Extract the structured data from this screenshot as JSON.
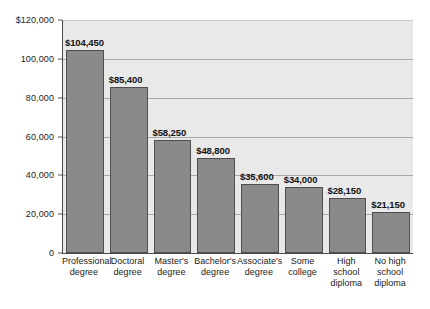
{
  "chart_data": {
    "type": "bar",
    "title": "",
    "subtitle": "",
    "xlabel": "",
    "ylabel": "",
    "ylim": [
      0,
      120000
    ],
    "grid": true,
    "legend": "none",
    "categories": [
      "Professional degree",
      "Doctoral degree",
      "Master's degree",
      "Bachelor's degree",
      "Associate's degree",
      "Some college",
      "High school diploma",
      "No high school diploma"
    ],
    "category_lines": [
      [
        "Professional",
        "degree"
      ],
      [
        "Doctoral",
        "degree"
      ],
      [
        "Master's",
        "degree"
      ],
      [
        "Bachelor's",
        "degree"
      ],
      [
        "Associate's",
        "degree"
      ],
      [
        "Some",
        "college"
      ],
      [
        "High school",
        "diploma"
      ],
      [
        "No high",
        "school",
        "diploma"
      ]
    ],
    "values": [
      104450,
      85400,
      58250,
      48800,
      35600,
      34000,
      28150,
      21150
    ],
    "data_labels": [
      "$104,450",
      "$85,400",
      "$58,250",
      "$48,800",
      "$35,600",
      "$34,000",
      "$28,150",
      "$21,150"
    ],
    "y_ticks": [
      0,
      20000,
      40000,
      60000,
      80000,
      100000,
      120000
    ],
    "y_tick_labels": [
      "0",
      "20,000",
      "40,000",
      "60,000",
      "80,000",
      "100,000",
      "$120,000"
    ],
    "colors": {
      "bar_fill": "#8a8a8a",
      "bar_border": "#4f4f4f",
      "plot_background": "#e9e9e9",
      "gridline": "#a9a9a9",
      "axis": "#4a4a4a",
      "page_background": "#ffffff",
      "text": "#1a1a1a"
    }
  }
}
